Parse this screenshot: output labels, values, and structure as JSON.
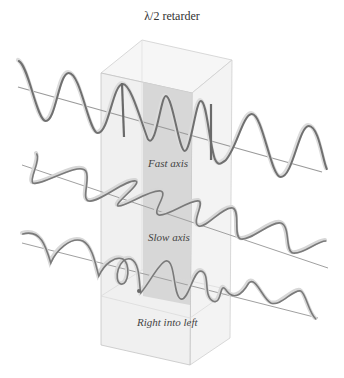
{
  "title": "λ/2 retarder",
  "labels": {
    "fast_axis": "Fast axis",
    "slow_axis": "Slow axis",
    "conversion": "Right into left"
  },
  "colors": {
    "box_face": "#ececec",
    "box_strip": "#d2d2d2",
    "box_edge": "#c4c4c4",
    "wave_dark": "#6a6a6a",
    "wave_light": "#d8d8d8",
    "axis_line": "#9a9a9a"
  }
}
